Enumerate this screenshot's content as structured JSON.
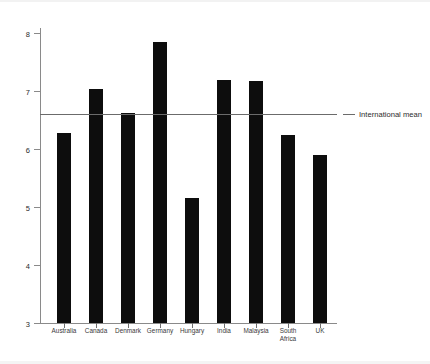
{
  "chart_data": {
    "type": "bar",
    "title": "",
    "xlabel": "",
    "ylabel": "",
    "ylim": [
      3,
      8
    ],
    "ytick_labels": [
      "8",
      "7",
      "6",
      "5",
      "4",
      "3"
    ],
    "ytick_values": [
      8,
      7,
      6,
      5,
      4,
      3
    ],
    "grid": false,
    "categories": [
      "Australia",
      "Canada",
      "Denmark",
      "Germany",
      "Hungary",
      "India",
      "Malaysia",
      "South\nAfrica",
      "UK"
    ],
    "values": [
      6.28,
      7.03,
      6.62,
      7.84,
      5.15,
      7.19,
      7.18,
      6.24,
      5.89
    ],
    "bar_color": "#0d0d0d",
    "annotations": [
      {
        "label": "International mean",
        "value": 6.6,
        "type": "horizontal-reference-line",
        "color": "#6b6b6b",
        "position": "right"
      }
    ],
    "legend": {
      "position": "right-of-line",
      "entries": [
        "International mean"
      ]
    }
  }
}
